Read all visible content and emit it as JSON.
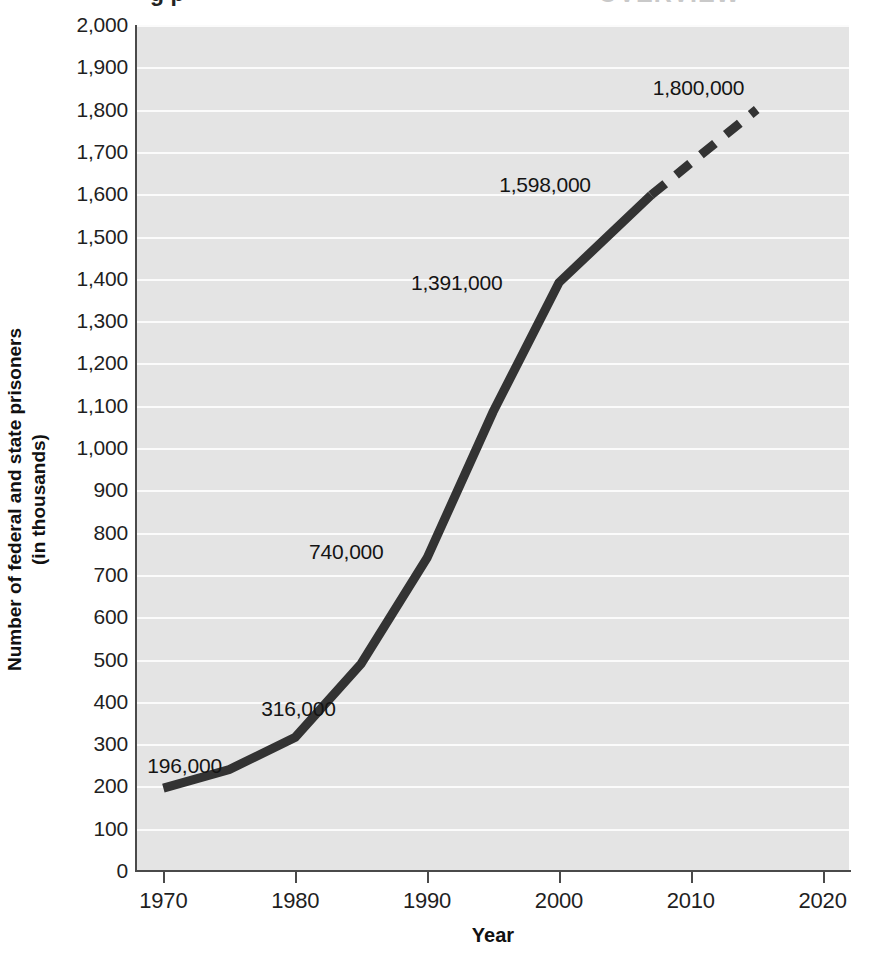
{
  "page": {
    "cropped_title_fragment": "g   p",
    "cropped_title_fragment_right": "OVERVIEW"
  },
  "chart_data": {
    "type": "line",
    "title": "",
    "xlabel": "Year",
    "ylabel": "Number of federal and state prisoners\n(in thousands)",
    "ylabel_line1": "Number of federal and state prisoners",
    "ylabel_line2": "(in thousands)",
    "xlim": [
      1968,
      2022
    ],
    "ylim": [
      0,
      2000
    ],
    "grid": true,
    "legend": "none",
    "x_ticks": [
      1970,
      1980,
      1990,
      2000,
      2010,
      2020
    ],
    "x_tick_labels": [
      "1970",
      "1980",
      "1990",
      "2000",
      "2010",
      "2020"
    ],
    "y_ticks": [
      0,
      100,
      200,
      300,
      400,
      500,
      600,
      700,
      800,
      900,
      1000,
      1100,
      1200,
      1300,
      1400,
      1500,
      1600,
      1700,
      1800,
      1900,
      2000
    ],
    "y_tick_labels": [
      "0",
      "100",
      "200",
      "300",
      "400",
      "500",
      "600",
      "700",
      "800",
      "900",
      "1,000",
      "1,100",
      "1,200",
      "1,300",
      "1,400",
      "1,500",
      "1,600",
      "1,700",
      "1,800",
      "1,900",
      "2,000"
    ],
    "series": [
      {
        "name": "Federal and state prisoners (actual)",
        "style": "solid",
        "color": "#333333",
        "x": [
          1970,
          1975,
          1980,
          1985,
          1990,
          1995,
          2000,
          2007
        ],
        "values": [
          196,
          240,
          316,
          490,
          740,
          1085,
          1391,
          1598
        ]
      },
      {
        "name": "Federal and state prisoners (projected)",
        "style": "dashed",
        "color": "#333333",
        "x": [
          2007,
          2015
        ],
        "values": [
          1598,
          1800
        ]
      }
    ],
    "annotations": [
      {
        "text": "196,000",
        "x": 1970,
        "value": 196
      },
      {
        "text": "316,000",
        "x": 1980,
        "value": 316
      },
      {
        "text": "740,000",
        "x": 1990,
        "value": 740
      },
      {
        "text": "1,391,000",
        "x": 2000,
        "value": 1391
      },
      {
        "text": "1,598,000",
        "x": 2007,
        "value": 1598
      },
      {
        "text": "1,800,000",
        "x": 2015,
        "value": 1800
      }
    ],
    "colors": {
      "plot_background": "#e4e4e4",
      "gridline": "#fbfbfb",
      "axis": "#4a4a4a",
      "line": "#333333",
      "text": "#1a1a1a"
    }
  }
}
